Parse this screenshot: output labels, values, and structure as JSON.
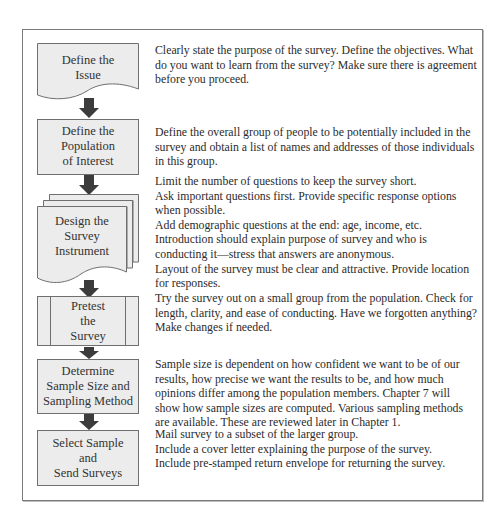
{
  "diagram": {
    "type": "flowchart",
    "colors": {
      "box_fill": "#ececec",
      "box_stroke": "#6f6f6f",
      "arrow": "#3c3c3c",
      "frame": "#7a7a7a",
      "text": "#2b2b2b"
    },
    "steps": [
      {
        "shape": "document",
        "label_lines": [
          "Define the",
          "Issue"
        ],
        "description_lines": [
          "Clearly state the purpose of the survey. Define the objectives. What",
          "do you want to learn from the survey? Make sure there is agreement",
          "before you proceed."
        ]
      },
      {
        "shape": "process",
        "label_lines": [
          "Define the",
          "Population",
          "of Interest"
        ],
        "description_lines": [
          "Define the overall group of people to be potentially included in the",
          "survey and obtain a list of names and addresses of those individuals",
          "in this group."
        ]
      },
      {
        "shape": "multi-document",
        "label_lines": [
          "Design the",
          "Survey",
          "Instrument"
        ],
        "description_lines": [
          "Limit the number of questions to keep the survey short.",
          "Ask important questions first. Provide specific response options",
          "when possible.",
          "Add demographic questions at the end: age, income, etc.",
          "Introduction should explain purpose of survey and who is",
          "conducting it—stress that answers are anonymous.",
          "Layout of the survey must be clear and attractive. Provide location",
          "for responses."
        ]
      },
      {
        "shape": "predefined-process",
        "label_lines": [
          "Pretest",
          "the",
          "Survey"
        ],
        "description_lines": [
          "Try the survey out on a small group from the population. Check for",
          "length, clarity, and ease of conducting. Have we forgotten anything?",
          "Make changes if needed."
        ]
      },
      {
        "shape": "process",
        "label_lines": [
          "Determine",
          "Sample Size and",
          "Sampling Method"
        ],
        "description_lines": [
          "Sample size is dependent on how confident we want to be of our",
          "results, how precise we want the results to be, and how much",
          "opinions differ among the population members. Chapter 7 will",
          "show how sample sizes are computed. Various sampling methods",
          "are available. These are reviewed later in Chapter 1."
        ]
      },
      {
        "shape": "process",
        "label_lines": [
          "Select Sample",
          "and",
          "Send Surveys"
        ],
        "description_lines": [
          "Mail survey to a subset of the larger group.",
          "Include a cover letter explaining the purpose of the survey.",
          "Include pre-stamped return envelope for returning the survey."
        ]
      }
    ]
  }
}
